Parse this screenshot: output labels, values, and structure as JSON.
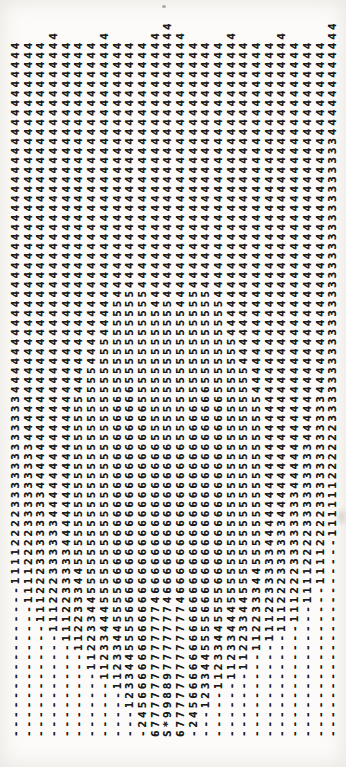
{
  "printout": {
    "lines": [
      "-----------------11112222333333333333-4444444444444444444444444444444444444",
      "---------------11112222333333333-444444444444444444444444444444444444444444",
      "-------------11122233333333-44444444444444444444444444444444444444444444444",
      "------------111222333333-444444444444444444444444444444444444444444444444444",
      "-----------1112233333-44444444444444444444444444444444444444444444444444444",
      "----------112233344-555555555555555555-4444444444444444444444444444444444444",
      "--------11223344-555555555555555555555555-4444444444444444444444444444444444",
      "-------1123344-45555555555555555555555555555-44444444444444444444444444444444",
      "------112334455-5566666666666666666666-5555555555-444444444444444444444444444",
      "----1233445555-666666666666666666666666-5555555555-44444444444444444444444444",
      "--245-6666666666666666666666666666666-555555555555-44444444444444444444444444",
      "-67777777777777466666666666666665555555555555544444444444444444444444444444",
      "S*9988977777774666666666666666655555555555555544444444444444444444444444444",
      "-67777777777777466666666666666665555555555555544444444444444444444444444444",
      "--245-6666666666666666666666666666666-555555555555-44444444444444444444444444",
      "----1233445555-666666666666666666666666-5555555555-44444444444444444444444444",
      "------112334455-5566666666666666666666-5555555555-444444444444444444444444444",
      "-------1123344-45555555555555555555555555555-44444444444444444444444444444444",
      "--------11223344-555555555555555555555555-4444444444444444444444444444444444",
      "----------112233344-555555555555555555-4444444444444444444444444444444444444",
      "-----------1112233333-44444444444444444444444444444444444444444444444444444",
      "------------111222333333-444444444444444444444444444444444444444444444444444",
      "-------------11122233333333-44444444444444444444444444444444444444444444444",
      "---------------11112222333333333-444444444444444444444444444444444444444444",
      "-----------------11112222333333333333-4444444444444444444444444444444444444",
      "----------------------111111222222333333333333333333333333333333444444444444"
    ]
  }
}
